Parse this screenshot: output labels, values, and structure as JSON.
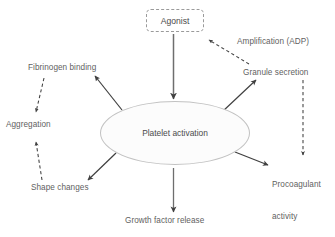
{
  "diagram": {
    "colors": {
      "text": "#5f5f5f",
      "solid_arrow": "#3f3f3f",
      "dashed_arrow": "#3f3f3f",
      "ellipse_stroke": "#c2c2c2",
      "ellipse_fill": "#fcfcfc",
      "box_stroke": "#9a9a9a",
      "background": "#ffffff"
    },
    "nodes": {
      "agonist": {
        "label": "Agonist",
        "shape": "rounded-rect-dashed"
      },
      "platelet_activation": {
        "label": "Platelet activation",
        "shape": "ellipse"
      },
      "fibrinogen_binding": {
        "label": "Fibrinogen binding",
        "shape": "text"
      },
      "aggregation": {
        "label": "Aggregation",
        "shape": "text"
      },
      "shape_changes": {
        "label": "Shape changes",
        "shape": "text"
      },
      "growth_factor_release": {
        "label": "Growth factor release",
        "shape": "text"
      },
      "amplification": {
        "label": "Amplification (ADP)",
        "shape": "text"
      },
      "granule_secretion": {
        "label": "Granule secretion",
        "shape": "text"
      },
      "procoagulant_activity": {
        "label": "Procoagulant\nactivity",
        "line1": "Procoagulant",
        "line2": "activity",
        "shape": "text"
      }
    },
    "edges": [
      {
        "name": "agonist-to-platelet",
        "from": "agonist",
        "to": "platelet_activation",
        "style": "solid"
      },
      {
        "name": "platelet-to-fibrinogen",
        "from": "platelet_activation",
        "to": "fibrinogen_binding",
        "style": "solid"
      },
      {
        "name": "platelet-to-shape-changes",
        "from": "platelet_activation",
        "to": "shape_changes",
        "style": "solid"
      },
      {
        "name": "platelet-to-growth-factor",
        "from": "platelet_activation",
        "to": "growth_factor_release",
        "style": "solid"
      },
      {
        "name": "platelet-to-granule",
        "from": "platelet_activation",
        "to": "granule_secretion",
        "style": "solid"
      },
      {
        "name": "platelet-to-procoagulant",
        "from": "platelet_activation",
        "to": "procoagulant_activity",
        "style": "solid"
      },
      {
        "name": "fibrinogen-to-aggregation",
        "from": "fibrinogen_binding",
        "to": "aggregation",
        "style": "dashed"
      },
      {
        "name": "shape-changes-to-aggregation",
        "from": "shape_changes",
        "to": "aggregation",
        "style": "dashed"
      },
      {
        "name": "granule-to-agonist-amplification",
        "from": "granule_secretion",
        "to": "agonist",
        "style": "dashed",
        "annotation": "Amplification (ADP)"
      },
      {
        "name": "granule-to-procoagulant",
        "from": "granule_secretion",
        "to": "procoagulant_activity",
        "style": "dashed"
      }
    ]
  }
}
